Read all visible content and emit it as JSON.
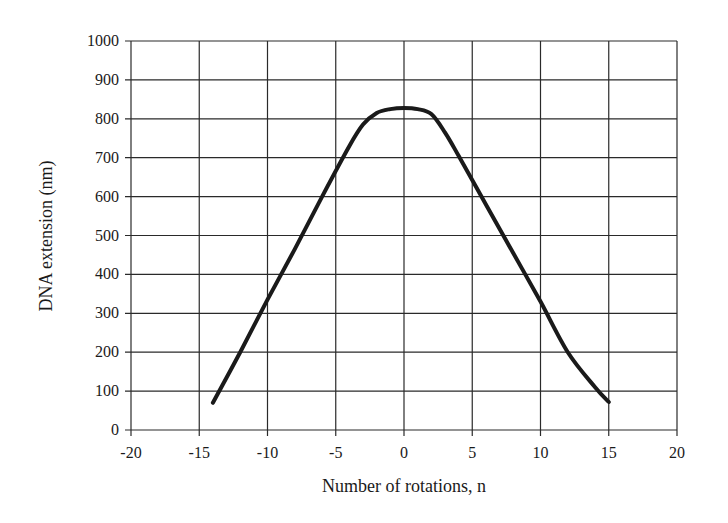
{
  "chart_data": {
    "type": "line",
    "title": "",
    "xlabel": "Number of rotations, n",
    "ylabel": "DNA extension (nm)",
    "xlim": [
      -20,
      20
    ],
    "ylim": [
      0,
      1000
    ],
    "x_ticks": [
      -20,
      -15,
      -10,
      -5,
      0,
      5,
      10,
      15,
      20
    ],
    "y_ticks": [
      0,
      100,
      200,
      300,
      400,
      500,
      600,
      700,
      800,
      900,
      1000
    ],
    "grid": true,
    "legend": null,
    "series": [
      {
        "name": "DNA extension",
        "x": [
          -14,
          -12,
          -10,
          -8,
          -6,
          -4,
          -3,
          -2,
          -1,
          0,
          1,
          2,
          3,
          4,
          6,
          8,
          10,
          12,
          14,
          15
        ],
        "y": [
          70,
          200,
          335,
          465,
          600,
          730,
          785,
          815,
          825,
          828,
          825,
          812,
          765,
          705,
          580,
          455,
          330,
          200,
          110,
          72
        ]
      }
    ]
  },
  "plot": {
    "x_axis_label": "Number of rotations, n",
    "y_axis_label": "DNA extension (nm)"
  }
}
